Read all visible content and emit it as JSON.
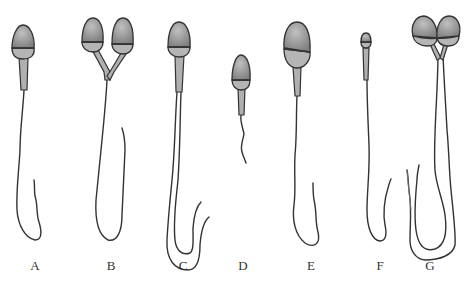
{
  "figure": {
    "type": "sperm-morphology-diagram",
    "colors": {
      "background": "#ffffff",
      "outline": "#333333",
      "head_fill": "#8f8f8f",
      "head_highlight": "#b8b8b8",
      "midpiece_fill": "#b0b0b0"
    },
    "panels": [
      {
        "label": "A",
        "x": 35,
        "description": "normal sperm"
      },
      {
        "label": "B",
        "x": 111,
        "description": "double head"
      },
      {
        "label": "C",
        "x": 183,
        "description": "double tail"
      },
      {
        "label": "D",
        "x": 243,
        "description": "short tail"
      },
      {
        "label": "E",
        "x": 311,
        "description": "macrocephalic head"
      },
      {
        "label": "F",
        "x": 380,
        "description": "microcephalic head"
      },
      {
        "label": "G",
        "x": 430,
        "description": "double head, double tail"
      }
    ]
  }
}
